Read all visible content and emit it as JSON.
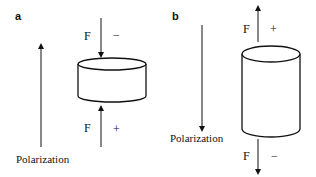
{
  "panels": [
    {
      "label": "a",
      "polarization": {
        "label": "Polarization",
        "direction": "up"
      },
      "cylinder": {
        "shape": "short-wide"
      },
      "top_force": {
        "label": "F",
        "sign": "−",
        "direction": "down"
      },
      "bottom_force": {
        "label": "F",
        "sign": "+",
        "direction": "up"
      }
    },
    {
      "label": "b",
      "polarization": {
        "label": "Polarization",
        "direction": "down"
      },
      "cylinder": {
        "shape": "tall-narrow"
      },
      "top_force": {
        "label": "F",
        "sign": "+",
        "direction": "up"
      },
      "bottom_force": {
        "label": "F",
        "sign": "−",
        "direction": "down"
      }
    }
  ],
  "colors": {
    "stroke": "#111111",
    "background": "#ffffff"
  }
}
